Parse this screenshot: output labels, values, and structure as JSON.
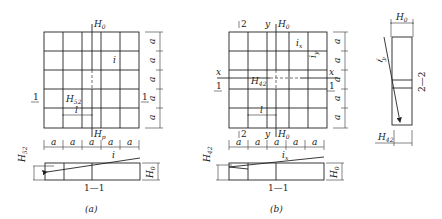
{
  "figure_a": {
    "caption": "(a)",
    "top_label": "H",
    "top_label_sub": "0",
    "bottom_label": "H",
    "bottom_label_sub": "p",
    "slope_label": "i",
    "point_label": "H",
    "point_label_sub": "52",
    "length_label": "l",
    "section_mark": "1",
    "dim_label": "a",
    "section_title": "1—1",
    "section_left_label": "H",
    "section_left_sub": "52",
    "section_right_label": "H",
    "section_right_sub": "0",
    "section_slope_label": "i"
  },
  "figure_b": {
    "caption": "(b)",
    "top_label": "H",
    "top_label_sub": "0",
    "bottom_label": "H",
    "bottom_label_sub": "0",
    "axis_x": "x",
    "axis_y": "y",
    "mark_2": "2",
    "slope_x_label": "i",
    "slope_x_sub": "x",
    "slope_y_label": "i",
    "slope_y_sub": "y",
    "point_label": "H",
    "point_label_sub": "42",
    "length_label": "l",
    "section_mark": "1",
    "dim_label": "a",
    "section_title": "1—1",
    "section_left_label": "H",
    "section_left_sub": "42",
    "section_right_label": "H",
    "section_right_sub": "0",
    "section_slope_label": "i",
    "section_slope_sub": "x"
  },
  "figure_c": {
    "top_label": "H",
    "top_label_sub": "0",
    "slope_label": "i",
    "slope_sub": "y",
    "bottom_label": "H",
    "bottom_label_sub": "42",
    "section_title": "2—2"
  }
}
